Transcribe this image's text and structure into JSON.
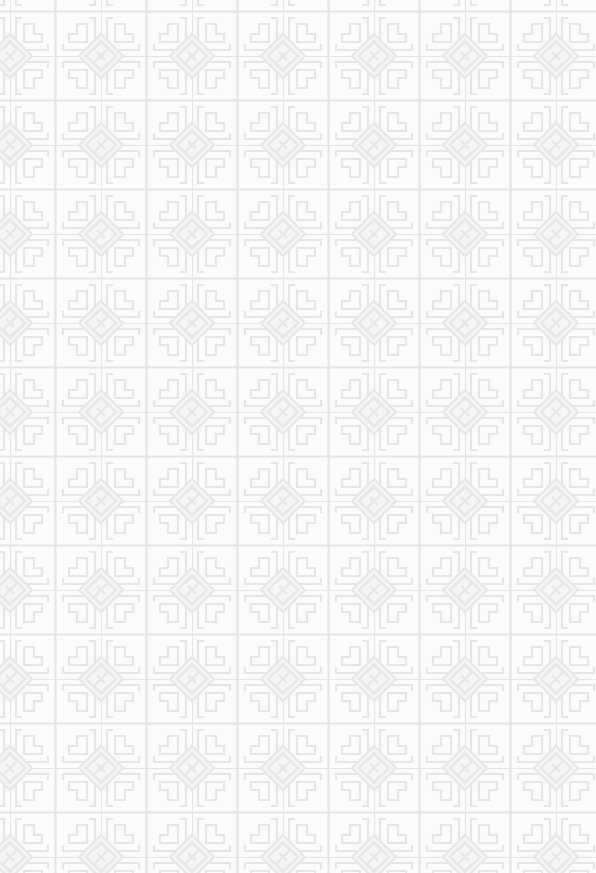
{
  "background": {
    "description": "Chinese lattice fretwork pattern with diamond key motifs",
    "base_color": "#fbfbfb",
    "line_color": "#e7e7e7",
    "motif_color": "#e9e9e9",
    "tile_width": 91,
    "tile_height": 89,
    "offset_x": 10,
    "offset_y": 56
  }
}
